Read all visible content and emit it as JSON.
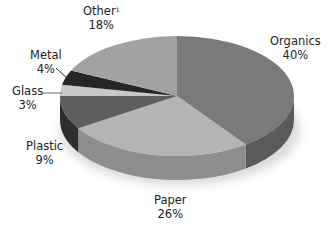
{
  "chart_data": {
    "type": "pie",
    "style": "3d",
    "title": "",
    "slices": [
      {
        "label": "Organics",
        "value": 40,
        "display": "40%",
        "color": "#7a7a7a",
        "side": "#5a5a5a"
      },
      {
        "label": "Paper",
        "value": 26,
        "display": "26%",
        "color": "#b4b4b4",
        "side": "#8e8e8e"
      },
      {
        "label": "Plastic",
        "value": 9,
        "display": "9%",
        "color": "#5e5e5e",
        "side": "#2e2e2e"
      },
      {
        "label": "Glass",
        "value": 3,
        "display": "3%",
        "color": "#c8c8c8",
        "side": "#9a9a9a"
      },
      {
        "label": "Metal",
        "value": 4,
        "display": "4%",
        "color": "#262626",
        "side": "#151515"
      },
      {
        "label": "Other",
        "value": 18,
        "display": "18%",
        "color": "#a2a2a2",
        "side": "#7e7e7e",
        "footnote": "1"
      }
    ],
    "legend": "none (direct labels)"
  },
  "labels": {
    "organics": {
      "name": "Organics",
      "pct": "40%"
    },
    "paper": {
      "name": "Paper",
      "pct": "26%"
    },
    "plastic": {
      "name": "Plastic",
      "pct": "9%"
    },
    "glass": {
      "name": "Glass",
      "pct": "3%"
    },
    "metal": {
      "name": "Metal",
      "pct": "4%"
    },
    "other": {
      "name": "Other",
      "pct": "18%",
      "footnote": "1"
    }
  }
}
